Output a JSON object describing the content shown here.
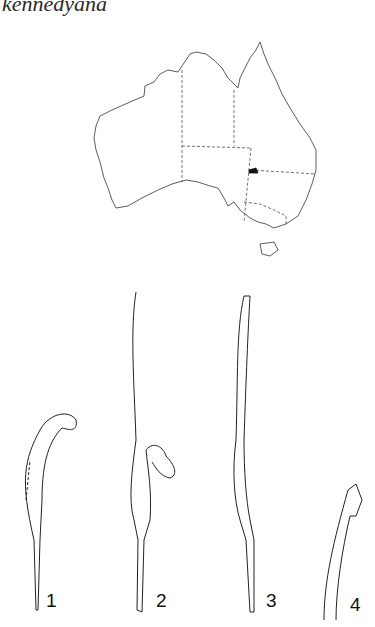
{
  "header": {
    "title": "kennedyana"
  },
  "map": {
    "region": "Australia",
    "caption": "Distribution map",
    "highlight_color": "#111111",
    "border_style": "dashed state boundaries"
  },
  "figures": [
    {
      "number": "1",
      "description": "curved petal/column, side view"
    },
    {
      "number": "2",
      "description": "column with floral parts and long stalk"
    },
    {
      "number": "3",
      "description": "elongated column with node"
    },
    {
      "number": "4",
      "description": "stippled tip detail"
    }
  ]
}
